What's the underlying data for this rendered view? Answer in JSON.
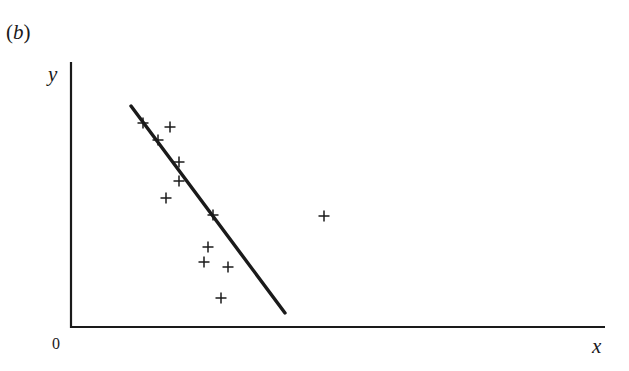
{
  "figure": {
    "panel_label": "(b)",
    "panel_letter": "b",
    "paren_open": "(",
    "paren_close": ")",
    "origin_label": "0",
    "x_axis_label": "x",
    "y_axis_label": "y"
  },
  "chart_data": {
    "type": "scatter",
    "title": "(b)",
    "xlabel": "x",
    "ylabel": "y",
    "origin_label": "0",
    "grid": false,
    "ticks": false,
    "marker": "+",
    "marker_color": "#1a1a1a",
    "axes_pixel": {
      "x0": 71,
      "y0": 327,
      "x_end": 605,
      "y_top": 62
    },
    "points_pixel": [
      [
        143,
        123
      ],
      [
        170,
        127
      ],
      [
        158,
        140
      ],
      [
        179,
        162
      ],
      [
        179,
        181
      ],
      [
        166,
        198
      ],
      [
        213,
        215
      ],
      [
        324,
        216
      ],
      [
        208,
        247
      ],
      [
        204,
        262
      ],
      [
        228,
        267
      ],
      [
        221,
        298
      ]
    ],
    "fit_line_pixel": {
      "x1": 131,
      "y1": 106,
      "x2": 285,
      "y2": 313
    },
    "note": "Fitted regression line with steep negative slope through the main cluster; one outlier point far to the right (approx. x=324, y=216 px)."
  }
}
